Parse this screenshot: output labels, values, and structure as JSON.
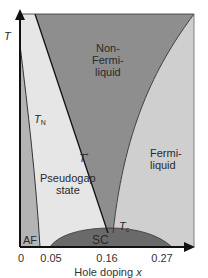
{
  "diagram": {
    "y_axis_label": "T",
    "x_axis_label": "Hole doping",
    "x_axis_variable": "x",
    "x_ticks": [
      "0",
      "0.05",
      "0.16",
      "0.27"
    ],
    "regions": {
      "non_fermi_liquid": [
        "Non-",
        "Fermi-",
        "liquid"
      ],
      "fermi_liquid": [
        "Fermi-",
        "liquid"
      ],
      "pseudogap": [
        "Pseudogap",
        "state"
      ],
      "af": "AF",
      "sc": "SC"
    },
    "line_labels": {
      "t_n_main": "T",
      "t_n_sub": "N",
      "t_star_main": "T",
      "t_star_sup": "*",
      "t_c_main": "T",
      "t_c_sub": "c"
    },
    "colors": {
      "non_fermi_liquid": "#8e8e8e",
      "fermi_liquid": "#cfcfcf",
      "pseudogap": "#e6e6e6",
      "af": "#b4b4b4",
      "sc": "#6a6a6a",
      "axis": "#111111"
    }
  }
}
